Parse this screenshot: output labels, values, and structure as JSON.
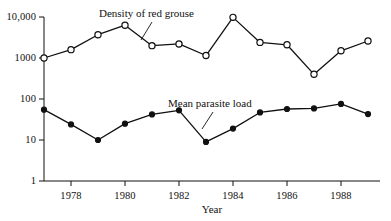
{
  "chart_data": {
    "type": "line",
    "title": "",
    "xlabel": "Year",
    "ylabel": "",
    "yscale": "log",
    "ylim": [
      1,
      10000
    ],
    "xlim": [
      1977,
      1989
    ],
    "grid": false,
    "legend_position": "inline-annotations",
    "y_ticks": [
      {
        "value": 10000,
        "label": "10,000"
      },
      {
        "value": 1000,
        "label": "1000"
      },
      {
        "value": 100,
        "label": "100"
      },
      {
        "value": 10,
        "label": "10"
      },
      {
        "value": 1,
        "label": "1"
      }
    ],
    "x_ticks": [
      {
        "value": 1978,
        "label": "1978"
      },
      {
        "value": 1980,
        "label": "1980"
      },
      {
        "value": 1982,
        "label": "1982"
      },
      {
        "value": 1984,
        "label": "1984"
      },
      {
        "value": 1986,
        "label": "1986"
      },
      {
        "value": 1988,
        "label": "1988"
      }
    ],
    "x": [
      1977,
      1978,
      1979,
      1980,
      1981,
      1982,
      1983,
      1984,
      1985,
      1986,
      1987,
      1988,
      1989
    ],
    "series": [
      {
        "name": "Density of red grouse",
        "marker": "open-circle",
        "color": "#111111",
        "values": [
          1000,
          1600,
          3700,
          6300,
          2000,
          2200,
          1150,
          9800,
          2400,
          2100,
          400,
          1500,
          2600
        ],
        "annotation": {
          "text": "Density of red grouse",
          "points_to_year": 1980
        }
      },
      {
        "name": "Mean parasite load",
        "marker": "filled-circle",
        "color": "#111111",
        "values": [
          55,
          24,
          10,
          25,
          42,
          53,
          9,
          19,
          47,
          57,
          59,
          76,
          43
        ],
        "annotation": {
          "text": "Mean parasite load",
          "points_to_year": 1983
        }
      }
    ]
  },
  "annotations": {
    "grouse_label": "Density of red grouse",
    "parasite_label": "Mean parasite load"
  },
  "axis": {
    "x_title": "Year"
  }
}
